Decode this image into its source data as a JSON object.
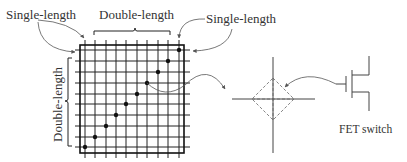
{
  "labels": {
    "single_length_left": "Single-length",
    "double_length_top": "Double-length",
    "single_length_right": "Single-length",
    "double_length_left": "Double-length",
    "fet_switch": "FET switch"
  },
  "colors": {
    "line": "#222222",
    "arrow": "#555555",
    "dashed": "#666666",
    "text": "#333333",
    "background": "#ffffff"
  },
  "grid": {
    "rows": 10,
    "cols": 10,
    "diagonal_dots": 10
  }
}
